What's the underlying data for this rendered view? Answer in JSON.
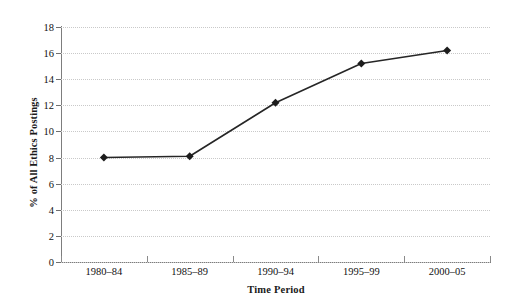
{
  "chart_data": {
    "type": "line",
    "title": "",
    "subtitle": "",
    "xlabel": "Time Period",
    "ylabel": "% of All Ethics Postings",
    "categories": [
      "1980–84",
      "1985–89",
      "1990–94",
      "1995–99",
      "2000–05"
    ],
    "values": [
      8.0,
      8.1,
      12.2,
      15.2,
      16.2
    ],
    "series": [
      {
        "name": "% of All Ethics Postings",
        "values": [
          8.0,
          8.1,
          12.2,
          15.2,
          16.2
        ]
      }
    ],
    "ylim": [
      0,
      18
    ],
    "ytick_step": 2,
    "yticks": [
      0,
      2,
      4,
      6,
      8,
      10,
      12,
      14,
      16,
      18
    ],
    "ytick_labels": [
      "0",
      "2",
      "4",
      "6",
      "8",
      "10",
      "12",
      "14",
      "16",
      "18"
    ],
    "xlim_bands": 5,
    "grid": true,
    "grid_axis": "y",
    "grid_style": "dotted",
    "legend": false,
    "legend_position": "none",
    "marker": "diamond",
    "annotations": []
  },
  "style": {
    "line_color": "#262626",
    "marker_color": "#1c1c1c",
    "grid_color": "#c9c9c9",
    "axis_color": "#7d7d7d",
    "text_color": "#111111",
    "background": "#ffffff"
  }
}
